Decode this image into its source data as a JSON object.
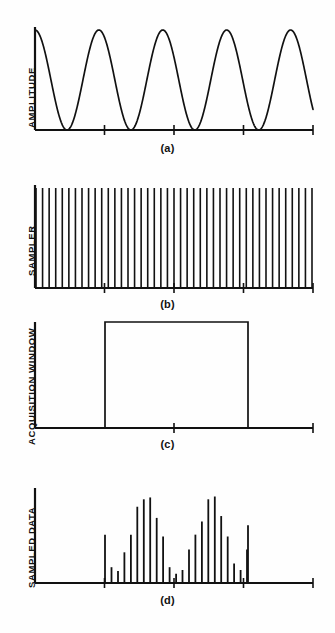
{
  "figure": {
    "background_color": "#fefefe",
    "ink_color": "#111111"
  },
  "panels": [
    {
      "id": "a",
      "caption": "(a)",
      "ylabel": "AMPLITUDE",
      "type": "line"
    },
    {
      "id": "b",
      "caption": "(b)",
      "ylabel": "SAMPLER",
      "type": "impulse-train"
    },
    {
      "id": "c",
      "caption": "(c)",
      "ylabel": "ACQUISITION WINDOW",
      "type": "rect-window"
    },
    {
      "id": "d",
      "caption": "(d)",
      "ylabel": "SAMPLED DATA",
      "type": "stem"
    }
  ],
  "chart_data": [
    {
      "type": "line",
      "panel": "a",
      "title": "(a)",
      "xlabel": "",
      "ylabel": "AMPLITUDE",
      "grid": false,
      "legend": "none",
      "xlim": [
        0,
        278
      ],
      "ylim": [
        0,
        1
      ],
      "axis_ticks_x": [
        69.5,
        139,
        208.5,
        278
      ],
      "waveform": {
        "shape": "cosine",
        "cycles": 4.35,
        "period_px": 64,
        "phase": "starts at positive peak",
        "amplitude_norm": 1.0,
        "peaks_x": [
          0,
          64,
          128,
          192,
          256
        ],
        "troughs_x": [
          32,
          96,
          160,
          224
        ]
      }
    },
    {
      "type": "bar",
      "panel": "b",
      "title": "(b)",
      "xlabel": "",
      "ylabel": "SAMPLER",
      "grid": false,
      "legend": "none",
      "xlim": [
        0,
        278
      ],
      "ylim": [
        0,
        1
      ],
      "axis_ticks_x": [
        69.5,
        139,
        208.5,
        278
      ],
      "description": "Uniform impulse train, all impulses equal height",
      "impulse_count": 43,
      "impulse_spacing_px": 6.45,
      "impulse_height_norm": 1.0
    },
    {
      "type": "area",
      "panel": "c",
      "title": "(c)",
      "xlabel": "",
      "ylabel": "ACQUISITION WINDOW",
      "grid": false,
      "legend": "none",
      "xlim": [
        0,
        278
      ],
      "ylim": [
        0,
        1
      ],
      "axis_ticks_x": [
        139,
        278
      ],
      "window": {
        "start_x": 70,
        "end_x": 213,
        "height_norm": 1.0,
        "label": "rectangular gate"
      }
    },
    {
      "type": "bar",
      "panel": "d",
      "title": "(d)",
      "xlabel": "",
      "ylabel": "SAMPLED DATA",
      "grid": false,
      "legend": "none",
      "xlim": [
        0,
        278
      ],
      "ylim": [
        0,
        1
      ],
      "axis_ticks_x": [
        69.5,
        139,
        208.5,
        278
      ],
      "description": "Product of sampler and windowed signal: rectified sine samples inside the acquisition window only",
      "sample_spacing_px": 6.45,
      "samples": [
        {
          "x": 70,
          "value": 0.52
        },
        {
          "x": 76.5,
          "value": 0.17
        },
        {
          "x": 83,
          "value": 0.13
        },
        {
          "x": 89.4,
          "value": 0.33
        },
        {
          "x": 95.9,
          "value": 0.52
        },
        {
          "x": 102.3,
          "value": 0.82
        },
        {
          "x": 108.8,
          "value": 0.9
        },
        {
          "x": 115.2,
          "value": 0.92
        },
        {
          "x": 121.7,
          "value": 0.7
        },
        {
          "x": 128.1,
          "value": 0.5
        },
        {
          "x": 134.6,
          "value": 0.17
        },
        {
          "x": 141.1,
          "value": 0.1
        },
        {
          "x": 147.5,
          "value": 0.14
        },
        {
          "x": 154.0,
          "value": 0.36
        },
        {
          "x": 160.4,
          "value": 0.52
        },
        {
          "x": 166.9,
          "value": 0.66
        },
        {
          "x": 173.3,
          "value": 0.9
        },
        {
          "x": 179.8,
          "value": 0.93
        },
        {
          "x": 186.2,
          "value": 0.72
        },
        {
          "x": 192.7,
          "value": 0.5
        },
        {
          "x": 199.1,
          "value": 0.21
        },
        {
          "x": 205.6,
          "value": 0.14
        },
        {
          "x": 212.0,
          "value": 0.36
        },
        {
          "x": 213,
          "value": 0.62
        }
      ]
    }
  ]
}
